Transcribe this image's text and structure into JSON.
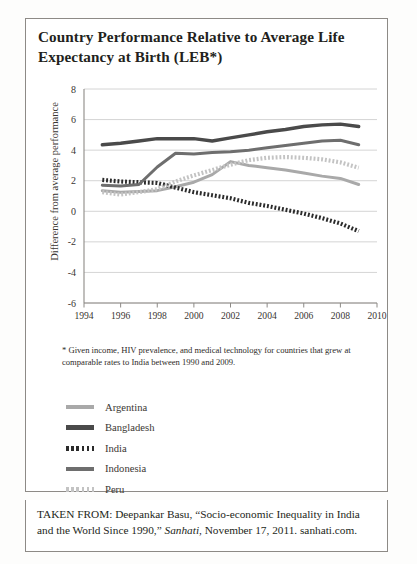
{
  "figure": {
    "title": "Country Performance Relative to Average Life Expectancy at Birth (LEB*)",
    "footnote": "* Given income, HIV prevalence, and medical technology for countries that grew at comparable rates to India between 1990 and 2009.",
    "source_prefix": "TAKEN FROM: Deepankar Basu, “Socio-economic Inequality in India and the World Since 1990,” ",
    "source_italic": "Sanhati",
    "source_suffix": ", November 17, 2011. sanhati.com."
  },
  "chart_data": {
    "type": "line",
    "title": "Country Performance Relative to Average Life Expectancy at Birth (LEB*)",
    "xlabel": "",
    "ylabel": "Difference from average performance",
    "xlim": [
      1994,
      2010
    ],
    "ylim": [
      -6,
      8
    ],
    "yticks": [
      8,
      6,
      4,
      2,
      0,
      -2,
      -4,
      -6
    ],
    "xticks": [
      1994,
      1996,
      1998,
      2000,
      2002,
      2004,
      2006,
      2008,
      2010
    ],
    "grid": "horizontal",
    "legend_position": "below-plot",
    "x": [
      1995,
      1996,
      1997,
      1998,
      1999,
      2000,
      2001,
      2002,
      2003,
      2004,
      2005,
      2006,
      2007,
      2008,
      2009
    ],
    "series": [
      {
        "name": "Argentina",
        "style": "solid",
        "color": "#a9a9a9",
        "values": [
          1.35,
          1.25,
          1.3,
          1.35,
          1.6,
          1.9,
          2.4,
          3.25,
          3.0,
          2.85,
          2.7,
          2.5,
          2.3,
          2.15,
          1.75
        ]
      },
      {
        "name": "Bangladesh",
        "style": "solid",
        "color": "#4a4a4a",
        "values": [
          4.35,
          4.45,
          4.6,
          4.75,
          4.75,
          4.75,
          4.6,
          4.8,
          5.0,
          5.2,
          5.35,
          5.55,
          5.65,
          5.7,
          5.55
        ]
      },
      {
        "name": "India",
        "style": "dotted",
        "color": "#2b2b2b",
        "values": [
          2.05,
          1.95,
          1.9,
          1.85,
          1.55,
          1.25,
          1.05,
          0.85,
          0.55,
          0.35,
          0.1,
          -0.15,
          -0.45,
          -0.8,
          -1.3
        ]
      },
      {
        "name": "Indonesia",
        "style": "solid",
        "color": "#6e6e6e",
        "values": [
          1.7,
          1.65,
          1.75,
          2.9,
          3.8,
          3.75,
          3.85,
          3.9,
          4.0,
          4.15,
          4.3,
          4.45,
          4.6,
          4.65,
          4.35
        ]
      },
      {
        "name": "Peru",
        "style": "dotted",
        "color": "#c3c3c3",
        "values": [
          1.25,
          1.1,
          1.25,
          1.45,
          1.95,
          2.35,
          2.7,
          3.05,
          3.35,
          3.5,
          3.55,
          3.5,
          3.4,
          3.2,
          2.85
        ]
      }
    ]
  },
  "legend": {
    "items": [
      {
        "label": "Argentina"
      },
      {
        "label": "Bangladesh"
      },
      {
        "label": "India"
      },
      {
        "label": "Indonesia"
      },
      {
        "label": "Peru"
      }
    ]
  }
}
